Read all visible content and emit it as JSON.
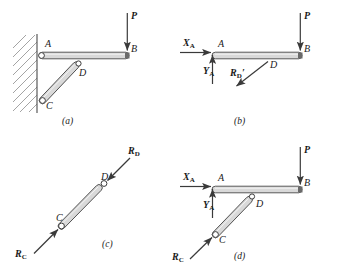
{
  "figure": {
    "colors": {
      "ink": "#3a3a3a",
      "member_fill": "#d9d9d9",
      "member_stroke": "#4a4a4a",
      "wall_hatch": "#9a9a9a",
      "text": "#1a1a1a"
    }
  },
  "panels": [
    {
      "id": "a",
      "caption": "(a)",
      "description": "Bracket assembly attached to wall",
      "joints": [
        {
          "name": "A",
          "label": "A"
        },
        {
          "name": "B",
          "label": "B"
        },
        {
          "name": "C",
          "label": "C"
        },
        {
          "name": "D",
          "label": "D"
        }
      ],
      "forces": [
        {
          "name": "P",
          "label": "P",
          "subscript": "",
          "prime": false,
          "direction": "down"
        }
      ]
    },
    {
      "id": "b",
      "caption": "(b)",
      "description": "Free-body diagram of horizontal member AB",
      "joints": [
        {
          "name": "A",
          "label": "A"
        },
        {
          "name": "B",
          "label": "B"
        },
        {
          "name": "D",
          "label": "D"
        }
      ],
      "forces": [
        {
          "name": "XA",
          "label": "X",
          "subscript": "A",
          "prime": false,
          "direction": "right"
        },
        {
          "name": "YA",
          "label": "Y",
          "subscript": "A",
          "prime": false,
          "direction": "up"
        },
        {
          "name": "P",
          "label": "P",
          "subscript": "",
          "prime": false,
          "direction": "down"
        },
        {
          "name": "RDprime",
          "label": "R",
          "subscript": "D",
          "prime": true,
          "direction": "down-left"
        }
      ]
    },
    {
      "id": "c",
      "caption": "(c)",
      "description": "Free-body diagram of two-force member CD",
      "joints": [
        {
          "name": "C",
          "label": "C"
        },
        {
          "name": "D",
          "label": "D"
        }
      ],
      "forces": [
        {
          "name": "RD",
          "label": "R",
          "subscript": "D",
          "prime": false,
          "direction": "down-left"
        },
        {
          "name": "RC",
          "label": "R",
          "subscript": "C",
          "prime": false,
          "direction": "up-right"
        }
      ]
    },
    {
      "id": "d",
      "caption": "(d)",
      "description": "Free-body diagram of complete bracket",
      "joints": [
        {
          "name": "A",
          "label": "A"
        },
        {
          "name": "B",
          "label": "B"
        },
        {
          "name": "C",
          "label": "C"
        },
        {
          "name": "D",
          "label": "D"
        }
      ],
      "forces": [
        {
          "name": "XA",
          "label": "X",
          "subscript": "A",
          "prime": false,
          "direction": "right"
        },
        {
          "name": "YA",
          "label": "Y",
          "subscript": "A",
          "prime": false,
          "direction": "up"
        },
        {
          "name": "P",
          "label": "P",
          "subscript": "",
          "prime": false,
          "direction": "down"
        },
        {
          "name": "RC",
          "label": "R",
          "subscript": "C",
          "prime": false,
          "direction": "up-right"
        }
      ]
    }
  ],
  "labels": {
    "A": "A",
    "B": "B",
    "C": "C",
    "D": "D",
    "P": "P",
    "X": "X",
    "Y": "Y",
    "R": "R",
    "sub_A": "A",
    "sub_C": "C",
    "sub_D": "D",
    "prime": "′",
    "caption_a": "(a)",
    "caption_b": "(b)",
    "caption_c": "(c)",
    "caption_d": "(d)"
  }
}
